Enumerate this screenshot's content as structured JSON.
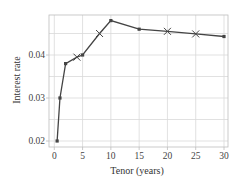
{
  "chart_data": {
    "type": "line",
    "title": "",
    "xlabel": "Tenor (years)",
    "ylabel": "Interest rate",
    "xlim": [
      -0.9,
      31
    ],
    "ylim": [
      0.0185,
      0.0492
    ],
    "xticks": [
      0,
      5,
      10,
      15,
      20,
      25,
      30
    ],
    "xtick_labels": [
      "0",
      "5",
      "10",
      "15",
      "20",
      "25",
      "30"
    ],
    "yticks": [
      0.02,
      0.03,
      0.04
    ],
    "ytick_labels": [
      "0.02",
      "0.03",
      "0.04"
    ],
    "minor_ygrid": [
      0.025,
      0.035,
      0.045
    ],
    "grid": true,
    "legend": null,
    "series": [
      {
        "name": "Yield curve",
        "color": "#444444",
        "points": [
          {
            "x": 0.5,
            "y": 0.02,
            "marker": "dot"
          },
          {
            "x": 1,
            "y": 0.03,
            "marker": "dot"
          },
          {
            "x": 2,
            "y": 0.038,
            "marker": "dot"
          },
          {
            "x": 4,
            "y": 0.0395,
            "marker": "x"
          },
          {
            "x": 5,
            "y": 0.04,
            "marker": "dot"
          },
          {
            "x": 8,
            "y": 0.045,
            "marker": "x"
          },
          {
            "x": 10,
            "y": 0.048,
            "marker": "dot"
          },
          {
            "x": 15,
            "y": 0.046,
            "marker": "dot"
          },
          {
            "x": 20,
            "y": 0.0455,
            "marker": "x"
          },
          {
            "x": 25,
            "y": 0.0449,
            "marker": "x"
          },
          {
            "x": 30,
            "y": 0.0443,
            "marker": "dot"
          }
        ]
      }
    ]
  },
  "colors": {
    "line": "#444444",
    "grid": "#d9d9d9",
    "frame": "#bdbdbd",
    "text": "#444444"
  }
}
